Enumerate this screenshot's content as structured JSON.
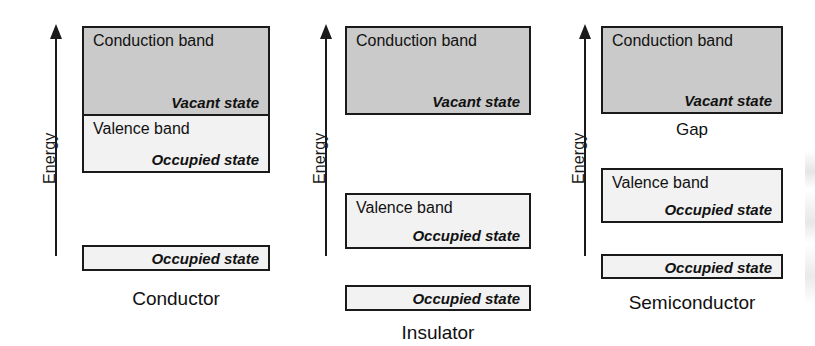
{
  "figure": {
    "type": "energy-band-diagram",
    "axis_label": "Energy",
    "panels": [
      {
        "id": "conductor",
        "caption": "Conductor",
        "bands": [
          {
            "name": "conduction-band",
            "title": "Conduction band",
            "state": "Vacant state",
            "fill": "#cacaca"
          },
          {
            "name": "valence-band",
            "title": "Valence band",
            "state": "Occupied state",
            "fill": "#f2f2f2"
          },
          {
            "name": "core-band",
            "title": "",
            "state": "Occupied state",
            "fill": "#f2f2f2"
          }
        ],
        "gap_label": ""
      },
      {
        "id": "insulator",
        "caption": "Insulator",
        "bands": [
          {
            "name": "conduction-band",
            "title": "Conduction band",
            "state": "Vacant state",
            "fill": "#cacaca"
          },
          {
            "name": "valence-band",
            "title": "Valence band",
            "state": "Occupied state",
            "fill": "#f2f2f2"
          },
          {
            "name": "core-band",
            "title": "",
            "state": "Occupied state",
            "fill": "#f2f2f2"
          }
        ],
        "gap_label": ""
      },
      {
        "id": "semiconductor",
        "caption": "Semiconductor",
        "bands": [
          {
            "name": "conduction-band",
            "title": "Conduction band",
            "state": "Vacant state",
            "fill": "#cacaca"
          },
          {
            "name": "valence-band",
            "title": "Valence band",
            "state": "Occupied state",
            "fill": "#f2f2f2"
          },
          {
            "name": "core-band",
            "title": "",
            "state": "Occupied state",
            "fill": "#f2f2f2"
          }
        ],
        "gap_label": "Gap"
      }
    ],
    "colors": {
      "conduction_fill": "#cacaca",
      "valence_fill": "#f2f2f2",
      "stroke": "#1a1a1a",
      "background": "#ffffff"
    }
  }
}
